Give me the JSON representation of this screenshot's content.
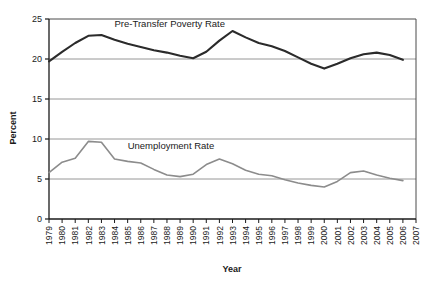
{
  "chart_data": {
    "type": "line",
    "title": "",
    "xlabel": "Year",
    "ylabel": "Percent",
    "ylim": [
      0,
      25
    ],
    "yticks": [
      0,
      5,
      10,
      15,
      20,
      25
    ],
    "ytick_labels": [
      "0",
      "5",
      "10",
      "15",
      "20",
      "25"
    ],
    "grid": "horizontal",
    "legend_position": "inline-labels",
    "categories": [
      "1979",
      "1980",
      "1981",
      "1982",
      "1983",
      "1984",
      "1985",
      "1986",
      "1987",
      "1988",
      "1989",
      "1990",
      "1991",
      "1992",
      "1993",
      "1994",
      "1995",
      "1996",
      "1997",
      "1998",
      "1999",
      "2000",
      "2001",
      "2002",
      "2003",
      "2004",
      "2005",
      "2006",
      "2007"
    ],
    "series": [
      {
        "name": "Pre-Transfer Poverty Rate",
        "color": "#2b2b2b",
        "label_x_year": "1984",
        "label_y_value": 24.0,
        "values": [
          19.7,
          20.9,
          22.0,
          22.9,
          23.0,
          22.4,
          21.9,
          21.5,
          21.1,
          20.8,
          20.4,
          20.1,
          20.9,
          22.3,
          23.5,
          22.7,
          22.0,
          21.6,
          21.0,
          20.2,
          19.4,
          18.8,
          19.4,
          20.1,
          20.6,
          20.8,
          20.5,
          19.9,
          null
        ]
      },
      {
        "name": "Unemployment Rate",
        "color": "#8c8c8c",
        "label_x_year": "1985",
        "label_y_value": 8.8,
        "values": [
          5.8,
          7.1,
          7.6,
          9.7,
          9.6,
          7.5,
          7.2,
          7.0,
          6.2,
          5.5,
          5.3,
          5.6,
          6.8,
          7.5,
          6.9,
          6.1,
          5.6,
          5.4,
          4.9,
          4.5,
          4.2,
          4.0,
          4.7,
          5.8,
          6.0,
          5.5,
          5.1,
          4.8,
          null
        ]
      }
    ]
  },
  "axis": {
    "x_title": "Year",
    "y_title": "Percent"
  },
  "colors": {
    "poverty_line": "#2b2b2b",
    "unemployment_line": "#8c8c8c",
    "gridline": "#8a8a8a",
    "axis": "#1a1a1a",
    "background": "#ffffff"
  }
}
